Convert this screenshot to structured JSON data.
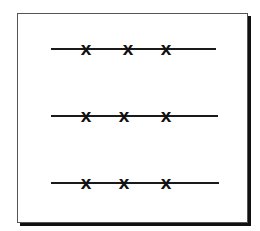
{
  "diagram": {
    "frame": {
      "left": 17,
      "top": 13,
      "width": 229,
      "height": 208
    },
    "rows": [
      {
        "y": 49,
        "line_x1": 51,
        "line_x2": 216,
        "marks": [
          {
            "x": 86,
            "label": "x"
          },
          {
            "x": 128,
            "label": "x"
          },
          {
            "x": 166,
            "label": "x"
          }
        ]
      },
      {
        "y": 116,
        "line_x1": 51,
        "line_x2": 218,
        "marks": [
          {
            "x": 86,
            "label": "x"
          },
          {
            "x": 124,
            "label": "x"
          },
          {
            "x": 166,
            "label": "x"
          }
        ]
      },
      {
        "y": 183,
        "line_x1": 51,
        "line_x2": 219,
        "marks": [
          {
            "x": 86,
            "label": "x"
          },
          {
            "x": 124,
            "label": "x"
          },
          {
            "x": 166,
            "label": "x"
          }
        ]
      }
    ],
    "colors": {
      "line": "#1a1a1a",
      "mark": "#111111",
      "shadow": "#111111",
      "border": "#555555"
    }
  }
}
